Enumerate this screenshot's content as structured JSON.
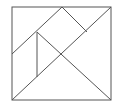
{
  "diagram": {
    "type": "tangram-square",
    "stroke_color": "#555555",
    "background": "#ffffff",
    "outline": {
      "x": 12,
      "y": 7,
      "width": 99,
      "height": 93
    },
    "lines": [
      {
        "name": "main-diagonal",
        "x1": 12,
        "y1": 100,
        "x2": 111,
        "y2": 7
      },
      {
        "name": "upper-left-diagonal",
        "x1": 12,
        "y1": 54,
        "x2": 62,
        "y2": 7
      },
      {
        "name": "top-small-edge",
        "x1": 62,
        "y1": 7,
        "x2": 87,
        "y2": 32
      },
      {
        "name": "cross-diagonal",
        "x1": 37,
        "y1": 32,
        "x2": 111,
        "y2": 100
      },
      {
        "name": "vertical-segment",
        "x1": 37,
        "y1": 32,
        "x2": 37,
        "y2": 77
      }
    ]
  }
}
